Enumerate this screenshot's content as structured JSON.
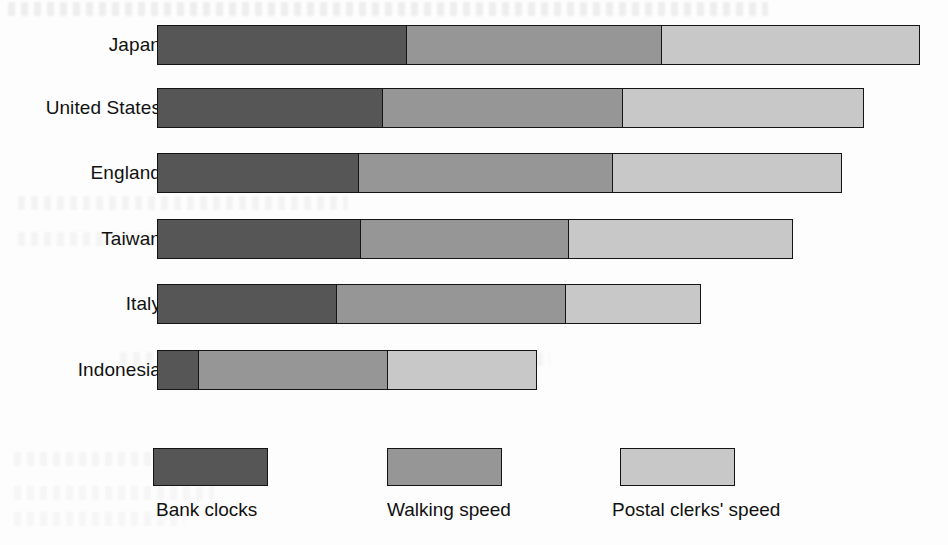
{
  "chart_data": {
    "type": "bar",
    "orientation": "horizontal",
    "stacked": true,
    "title": "",
    "subtitle": "",
    "xlabel": "",
    "ylabel": "",
    "grid": false,
    "legend_position": "bottom",
    "categories": [
      "Japan",
      "United States",
      "England",
      "Taiwan",
      "Italy",
      "Indonesia"
    ],
    "series": [
      {
        "name": "Bank clocks",
        "color": "#565656",
        "values": [
          251,
          227,
          203,
          205,
          181,
          43
        ]
      },
      {
        "name": "Walking speed",
        "color": "#969696",
        "values": [
          256,
          241,
          255,
          209,
          230,
          190
        ]
      },
      {
        "name": "Postal clerks' speed",
        "color": "#c8c8c8",
        "values": [
          259,
          242,
          230,
          225,
          136,
          150
        ]
      }
    ],
    "totals": [
      766,
      710,
      688,
      639,
      547,
      383
    ],
    "units": "relative bar length (pixels)",
    "xlim": [
      0,
      766
    ]
  },
  "rows": [
    {
      "label": "Japan",
      "top": 25,
      "segments": [
        251,
        256,
        259
      ]
    },
    {
      "label": "United States",
      "top": 88,
      "segments": [
        227,
        241,
        242
      ]
    },
    {
      "label": "England",
      "top": 153,
      "segments": [
        203,
        255,
        230
      ]
    },
    {
      "label": "Taiwan",
      "top": 219,
      "segments": [
        205,
        209,
        225
      ]
    },
    {
      "label": "Italy",
      "top": 284,
      "segments": [
        181,
        230,
        136
      ]
    },
    {
      "label": "Indonesia",
      "top": 350,
      "segments": [
        43,
        190,
        150
      ]
    }
  ],
  "legend": {
    "items": [
      {
        "label": "Bank clocks",
        "color": "#565656"
      },
      {
        "label": "Walking speed",
        "color": "#969696"
      },
      {
        "label": "Postal clerks' speed",
        "color": "#c8c8c8"
      }
    ]
  },
  "palette": {
    "dark_gray": "#565656",
    "mid_gray": "#969696",
    "light_gray": "#c8c8c8",
    "outline": "#141414",
    "page_background": "#fdfdfd",
    "text": "#111111"
  }
}
